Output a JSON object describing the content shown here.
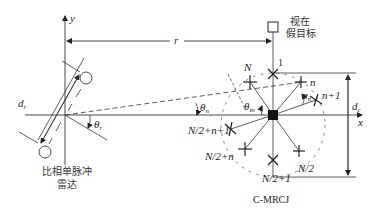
{
  "diagram": {
    "axes": {
      "x_label": "x",
      "y_label": "y"
    },
    "radar": {
      "label_line1": "比相单脉冲",
      "label_line2": "雷达",
      "baseline_label": "d",
      "baseline_sub": "r",
      "angle_label": "θ",
      "angle_sub": "r"
    },
    "range": {
      "label": "r"
    },
    "false_target": {
      "label_line1": "视在",
      "label_line2": "假目标"
    },
    "jammer": {
      "caption": "C-MRCJ",
      "diameter_label": "d",
      "diameter_sub": "c",
      "angle_n_label": "θ",
      "angle_n_sub": "n",
      "angle_in_label": "θ",
      "angle_in_sub": "in",
      "alpha_label": "α",
      "alpha_sub": "n",
      "elements": [
        {
          "id": "1",
          "label": "1"
        },
        {
          "id": "n",
          "label": "n"
        },
        {
          "id": "n+1",
          "label": "n+1"
        },
        {
          "id": "N/2",
          "label": "N/2"
        },
        {
          "id": "N/2+1",
          "label": "N/2+1"
        },
        {
          "id": "N/2+n",
          "label": "N/2+n"
        },
        {
          "id": "N/2+n+1",
          "label": "N/2+n+1"
        },
        {
          "id": "N",
          "label": "N"
        }
      ]
    }
  }
}
